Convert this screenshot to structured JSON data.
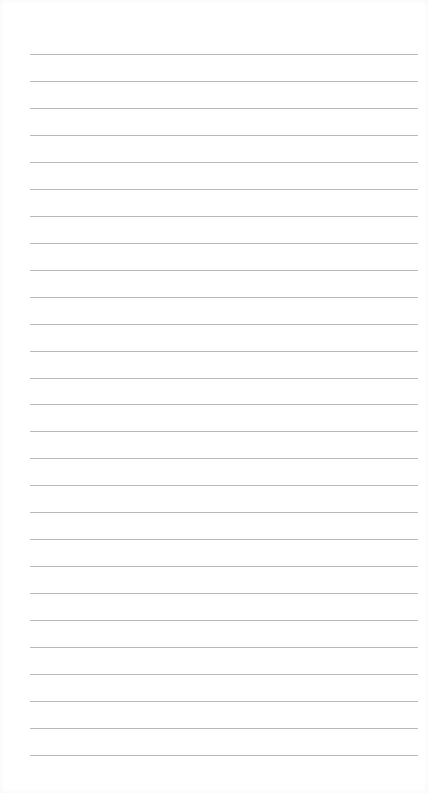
{
  "page": {
    "type": "lined-paper",
    "background_color": "#ffffff",
    "line_color": "#b9b9b9",
    "line_count": 27,
    "first_line_y": 54,
    "line_spacing": 26.96,
    "line_left": 30,
    "line_right": 418
  }
}
